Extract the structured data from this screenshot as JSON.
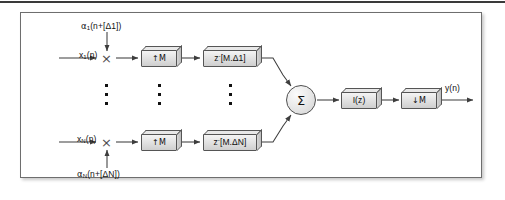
{
  "figure": {
    "kind": "signal-processing-block-diagram",
    "frame_border_color": "#6e6e6e",
    "background_color": "#ffffff",
    "line_color": "#3d3d3d"
  },
  "top_rule": {
    "color": "#3a3a3a"
  },
  "branches": {
    "top": {
      "input_label_text": "x",
      "input_label_sub": "1",
      "input_label_tail": "(n)",
      "coefficient_text": "α",
      "coefficient_sub": "1",
      "coefficient_tail": "(n+[Δ1])",
      "multiplier_symbol": "×",
      "upsampler_label": "↑M",
      "delay_label_base": "z",
      "delay_label_sup": "-",
      "delay_label_tail": "[M.Δ1]"
    },
    "bottom": {
      "input_label_text": "x",
      "input_label_sub": "N",
      "input_label_tail": "(n)",
      "coefficient_text": "α",
      "coefficient_sub": "N",
      "coefficient_tail": "(n+[ΔN])",
      "multiplier_symbol": "×",
      "upsampler_label": "↑M",
      "delay_label_base": "z",
      "delay_label_sup": "-",
      "delay_label_tail": "[M.ΔN]"
    }
  },
  "summation": {
    "symbol": "Σ",
    "name": "summation-node"
  },
  "output_chain": {
    "filter_label": "I(z)",
    "downsampler_label": "↓M",
    "output_label": "y(n)"
  },
  "ellipsis": {
    "dot_count": 3,
    "columns": 3
  }
}
